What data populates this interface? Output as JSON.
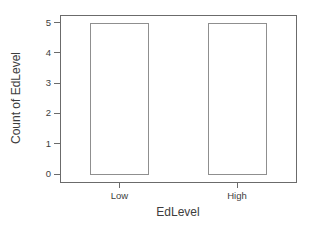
{
  "chart_data": {
    "type": "bar",
    "title": "",
    "xlabel": "EdLevel",
    "ylabel": "Count of EdLevel",
    "categories": [
      "Low",
      "High"
    ],
    "values": [
      5,
      5
    ],
    "ylim": [
      0,
      5
    ],
    "yticks": [
      0,
      1,
      2,
      3,
      4,
      5
    ],
    "grid": false,
    "legend_position": "none",
    "colors": {
      "background": "#ffffff",
      "bar_fill": "#ffffff",
      "bar_border": "#8f8f8f",
      "axis": "#6b6b6b",
      "text": "#3d3d3d"
    }
  }
}
